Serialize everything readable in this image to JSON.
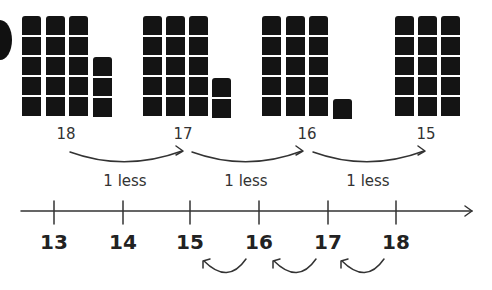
{
  "question_badge": "circle-marker",
  "groups": [
    {
      "total": "18",
      "full_columns": 3,
      "cubes_per_column": 5,
      "extra_cubes": 3,
      "col_x": [
        22,
        46,
        69,
        93
      ],
      "label_x": 66
    },
    {
      "total": "17",
      "full_columns": 3,
      "cubes_per_column": 5,
      "extra_cubes": 2,
      "col_x": [
        143,
        166,
        189,
        212
      ],
      "label_x": 183
    },
    {
      "total": "16",
      "full_columns": 3,
      "cubes_per_column": 5,
      "extra_cubes": 1,
      "col_x": [
        262,
        286,
        309,
        333
      ],
      "label_x": 307
    },
    {
      "total": "15",
      "full_columns": 3,
      "cubes_per_column": 5,
      "extra_cubes": 0,
      "col_x": [
        395,
        418,
        441
      ],
      "label_x": 426
    }
  ],
  "top_arrows": [
    {
      "label": "1 less",
      "label_x": 125
    },
    {
      "label": "1 less",
      "label_x": 246
    },
    {
      "label": "1 less",
      "label_x": 368
    }
  ],
  "number_line": {
    "ticks": [
      "13",
      "14",
      "15",
      "16",
      "17",
      "18"
    ],
    "tick_x": [
      54,
      123,
      190,
      259,
      328,
      396
    ]
  },
  "bottom_arrows": [
    {
      "from": "16",
      "to": "15"
    },
    {
      "from": "17",
      "to": "16"
    },
    {
      "from": "18",
      "to": "17"
    }
  ]
}
